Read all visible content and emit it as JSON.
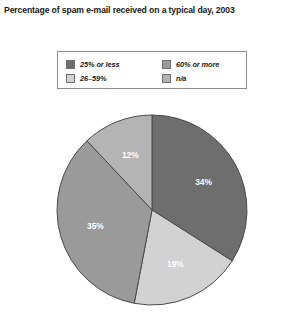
{
  "chart_data": {
    "type": "pie",
    "title": "Percentage of spam e-mail received on a typical day, 2003",
    "xlabel": "",
    "ylabel": "",
    "legend_position": "top",
    "grid": false,
    "start_angle_deg": 0,
    "direction": "clockwise",
    "categories": [
      "25% or less",
      "26–59%",
      "60% or more",
      "n/a"
    ],
    "values": [
      34,
      19,
      35,
      12
    ],
    "labels": [
      "34%",
      "19%",
      "35%",
      "12%"
    ],
    "colors": [
      "#6e6e6e",
      "#d2d2d2",
      "#9a9a9a",
      "#b4b4b4"
    ],
    "label_colors": [
      "#ffffff",
      "#2b2b2b",
      "#ffffff",
      "#2b2b2b"
    ],
    "slices": [
      {
        "name": "25% or less",
        "value": 34,
        "label": "34%",
        "color": "#6e6e6e",
        "label_color": "#ffffff"
      },
      {
        "name": "26–59%",
        "value": 19,
        "label": "19%",
        "color": "#d2d2d2",
        "label_color": "#2b2b2b"
      },
      {
        "name": "60% or more",
        "value": 35,
        "label": "35%",
        "color": "#9a9a9a",
        "label_color": "#ffffff"
      },
      {
        "name": "n/a",
        "value": 12,
        "label": "12%",
        "color": "#b4b4b4",
        "label_color": "#2b2b2b"
      }
    ]
  },
  "title": {
    "text": "Percentage of spam e-mail received on a typical day, 2003"
  },
  "legend": {
    "entries": [
      {
        "label": "25% or less",
        "color": "#6e6e6e"
      },
      {
        "label": "60% or more",
        "color": "#9a9a9a"
      },
      {
        "label": "26–59%",
        "color": "#d2d2d2"
      },
      {
        "label": "n/a",
        "color": "#b4b4b4"
      }
    ]
  },
  "pie": {
    "center_x": 152,
    "center_y": 210,
    "radius": 95,
    "outline_color": "#4a4a4a"
  }
}
